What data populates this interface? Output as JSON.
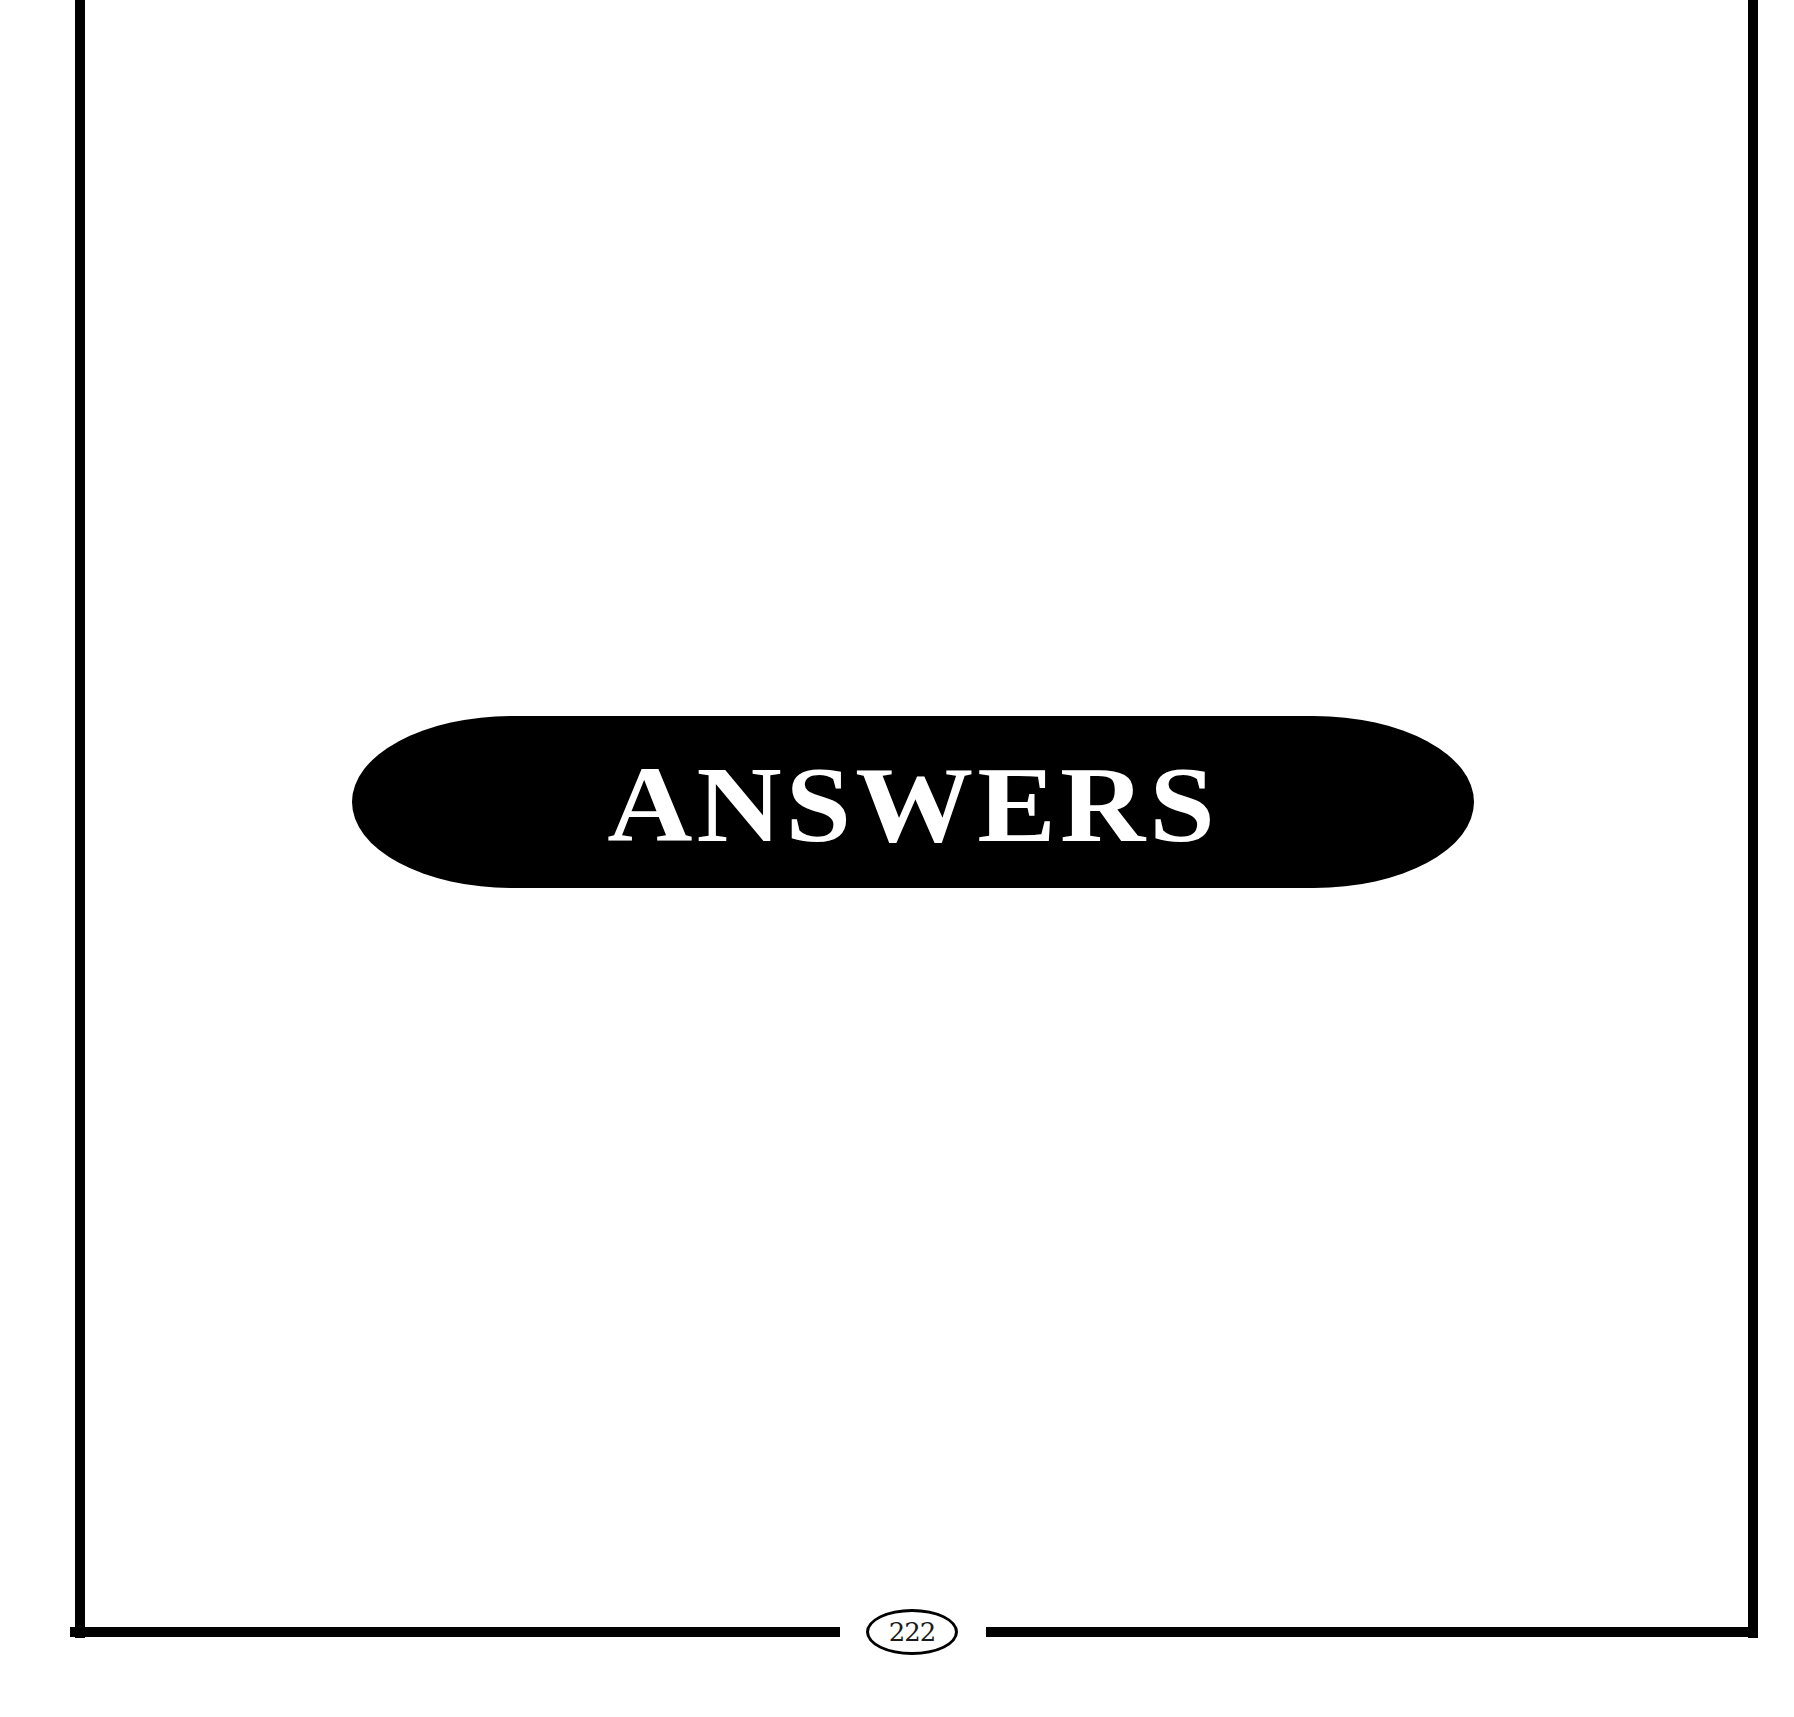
{
  "page": {
    "section_title": "ANSWERS",
    "page_number": "222"
  },
  "colors": {
    "background": "#ffffff",
    "ink": "#000000",
    "banner_text": "#ffffff"
  }
}
